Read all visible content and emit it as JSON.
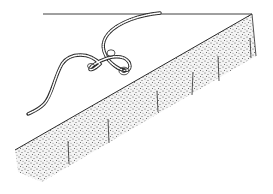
{
  "illustration": {
    "subject": "cord tied with a loop knot lying on top of a stippled slab edge",
    "colors": {
      "background": "#ffffff",
      "ink": "#2a2a2a",
      "stipple": "#444444"
    },
    "elements": [
      "horizon-line",
      "cord",
      "knot",
      "slab-top-edge",
      "slab-front-face",
      "crease-lines"
    ]
  }
}
